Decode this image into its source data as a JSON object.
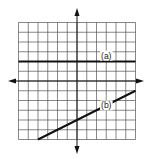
{
  "chart_data": {
    "type": "line",
    "title": "",
    "xlabel": "",
    "ylabel": "",
    "xlim": [
      -6,
      6
    ],
    "ylim": [
      -6,
      6
    ],
    "grid": true,
    "grid_step": 1,
    "axes_arrows": true,
    "series": [
      {
        "name": "(a)",
        "equation": "y = 2",
        "x": [
          -6,
          6
        ],
        "y": [
          2,
          2
        ],
        "label_pos": [
          3,
          2.6
        ]
      },
      {
        "name": "(b)",
        "equation": "y = 0.5x - 4",
        "x": [
          -4,
          6
        ],
        "y": [
          -6,
          -1
        ],
        "label_pos": [
          3,
          -2.5
        ]
      }
    ]
  },
  "labels": {
    "line_a": "(a)",
    "line_b": "(b)"
  },
  "colors": {
    "grid": "#555555",
    "axis": "#111111",
    "line": "#111111",
    "background": "#ffffff"
  },
  "layout": {
    "origin_px": [
      77,
      81
    ],
    "unit_px": 9.75
  }
}
